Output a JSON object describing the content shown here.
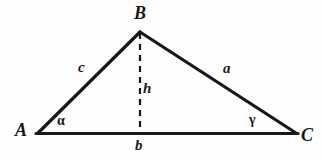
{
  "figure": {
    "kind": "geometry-diagram",
    "background_color": "#fefefe",
    "stroke_color": "#17171a"
  },
  "labels": {
    "vertex_a": "A",
    "vertex_b": "B",
    "vertex_c": "C",
    "side_a": "a",
    "side_b": "b",
    "side_c": "c",
    "height": "h",
    "angle_alpha": "α",
    "angle_gamma": "γ"
  },
  "geometry": {
    "points": {
      "A": {
        "x": 38,
        "y": 133
      },
      "B": {
        "x": 140,
        "y": 32
      },
      "C": {
        "x": 296,
        "y": 133
      },
      "foot_of_altitude": {
        "x": 140,
        "y": 133
      }
    },
    "edges": [
      {
        "name": "side-c",
        "from": "A",
        "to": "B",
        "style": "solid",
        "width": 3.2
      },
      {
        "name": "side-a",
        "from": "B",
        "to": "C",
        "style": "solid",
        "width": 3.2
      },
      {
        "name": "side-b",
        "from": "A",
        "to": "C",
        "style": "solid",
        "width": 3.2
      },
      {
        "name": "altitude-h",
        "from": "B",
        "to": "foot_of_altitude",
        "style": "dashed",
        "width": 2.2
      }
    ],
    "dash_pattern": "6 5"
  }
}
